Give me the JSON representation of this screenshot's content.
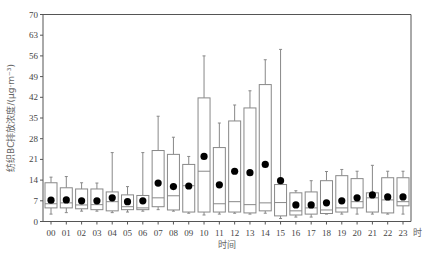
{
  "chart_data": {
    "type": "box",
    "title": "",
    "xlabel": "时间",
    "x_unit": "时",
    "ylabel": "纺织BC排放浓度/(μg·m⁻³)",
    "ylim": [
      0,
      70
    ],
    "yticks": [
      0,
      7,
      14,
      21,
      28,
      35,
      42,
      49,
      56,
      63,
      70
    ],
    "grid": false,
    "categories": [
      "00",
      "01",
      "02",
      "03",
      "04",
      "05",
      "06",
      "07",
      "08",
      "09",
      "10",
      "11",
      "12",
      "13",
      "14",
      "15",
      "16",
      "17",
      "18",
      "19",
      "20",
      "21",
      "22",
      "23"
    ],
    "series": [
      {
        "name": "whisker_low",
        "values": [
          2.5,
          3.0,
          3.5,
          3.5,
          3.0,
          3.2,
          3.5,
          4.0,
          3.5,
          2.8,
          2.2,
          2.5,
          2.8,
          2.5,
          2.8,
          1.0,
          1.5,
          1.5,
          2.5,
          2.5,
          2.5,
          2.5,
          2.5,
          2.5
        ]
      },
      {
        "name": "q1",
        "values": [
          4.6,
          4.6,
          4.3,
          4.0,
          3.6,
          4.0,
          4.0,
          5.0,
          3.9,
          3.2,
          3.2,
          3.2,
          3.2,
          2.9,
          3.6,
          1.9,
          2.2,
          2.5,
          2.7,
          3.2,
          4.6,
          3.2,
          2.9,
          5.3
        ]
      },
      {
        "name": "median",
        "values": [
          6.0,
          6.3,
          5.6,
          5.7,
          6.7,
          5.0,
          4.6,
          8.0,
          8.7,
          12.1,
          17.0,
          6.0,
          6.7,
          5.7,
          6.3,
          6.4,
          3.6,
          4.6,
          3.9,
          4.6,
          6.7,
          8.0,
          7.3,
          6.7
        ]
      },
      {
        "name": "q3",
        "values": [
          13.1,
          11.4,
          11.0,
          11.0,
          10.0,
          9.0,
          8.8,
          24.0,
          22.7,
          19.3,
          41.8,
          25.0,
          34.0,
          38.4,
          46.3,
          12.5,
          9.7,
          10.0,
          13.8,
          15.5,
          14.5,
          9.7,
          14.8,
          14.8
        ]
      },
      {
        "name": "whisker_high",
        "values": [
          15.0,
          15.2,
          13.1,
          13.0,
          23.3,
          11.8,
          23.3,
          35.6,
          28.5,
          22.0,
          56.0,
          33.3,
          39.4,
          44.2,
          54.7,
          58.2,
          10.4,
          13.8,
          16.9,
          17.6,
          17.0,
          19.0,
          17.0,
          17.0
        ]
      },
      {
        "name": "mean",
        "values": [
          7.2,
          7.3,
          7.0,
          7.0,
          8.0,
          6.7,
          7.0,
          13.0,
          11.8,
          12.0,
          22.0,
          12.4,
          17.0,
          16.5,
          19.3,
          13.8,
          5.6,
          5.6,
          6.3,
          7.0,
          8.0,
          9.0,
          8.3,
          8.3
        ]
      }
    ]
  },
  "colors": {
    "axis": "#555555",
    "box_stroke": "#888888",
    "mean_marker": "#000000"
  }
}
